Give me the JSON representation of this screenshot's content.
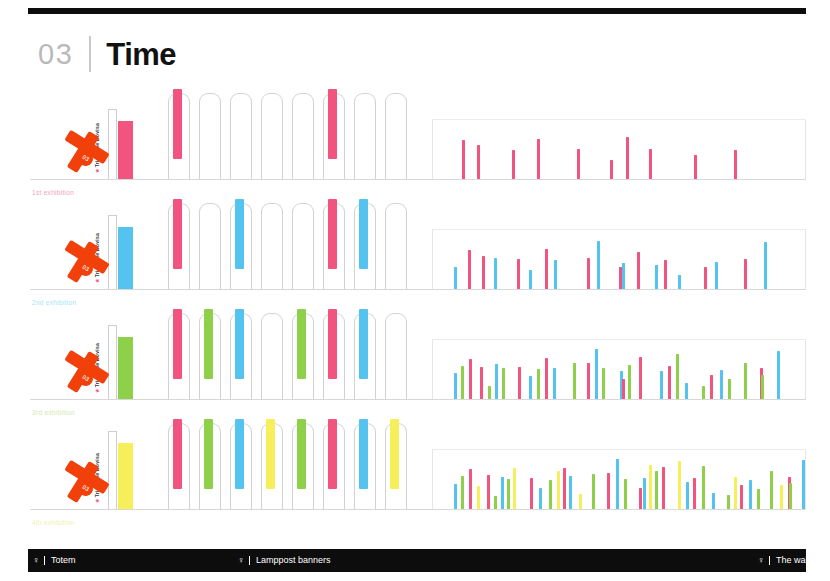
{
  "header": {
    "section_number": "03",
    "title": "Time"
  },
  "colors": {
    "pink": "#f0547f",
    "blue": "#54c3ef",
    "green": "#8ed04a",
    "yellow": "#f7ef5a",
    "orange_sign": "#f2400a",
    "black_bar": "#0d0d0d",
    "lamppost_outline": "#d2d2d2",
    "baseline": "#d8d8d8"
  },
  "legend": {
    "items": [
      {
        "icon": "totem-icon",
        "glyph": "♀",
        "label": "Totem"
      },
      {
        "icon": "lamppost-icon",
        "glyph": "♀",
        "label": "Lamppost banners"
      },
      {
        "icon": "wall-icon",
        "glyph": "♀",
        "label": "The wall"
      }
    ]
  },
  "chart_data": {
    "type": "bar",
    "title": "Time",
    "xlabel": "",
    "ylabel": "",
    "grid": false,
    "legend_position": "bottom",
    "categories": [
      "Totem",
      "Lamppost banners",
      "The wall"
    ],
    "series": [
      {
        "name": "1st exhibition",
        "color": "#f0547f",
        "label_color": "#f7a2b9"
      },
      {
        "name": "2nd exhibition",
        "color": "#54c3ef",
        "label_color": "#a8dff7"
      },
      {
        "name": "3rd exhibition",
        "color": "#8ed04a",
        "label_color": "#d4e9b0"
      },
      {
        "name": "4th exhibition",
        "color": "#f7ef5a",
        "label_color": "#f6f0a8"
      }
    ],
    "rows": [
      {
        "label": "1st exhibition",
        "label_color": "#f7a2b9",
        "totem": {
          "vertical_text": "Triennale Bovisa",
          "bar_color": "#f0547f",
          "bar_height": 58,
          "post_height": 70
        },
        "lampposts": [
          {
            "color": "#f0547f"
          },
          {
            "color": null
          },
          {
            "color": null
          },
          {
            "color": null
          },
          {
            "color": null
          },
          {
            "color": "#f0547f"
          },
          {
            "color": null
          },
          {
            "color": null
          }
        ],
        "wall": {
          "bars": [
            {
              "x": 30,
              "h": 39,
              "color": "#f0547f"
            },
            {
              "x": 45,
              "h": 34,
              "color": "#f0547f"
            },
            {
              "x": 80,
              "h": 29,
              "color": "#f0547f"
            },
            {
              "x": 105,
              "h": 40,
              "color": "#f0547f"
            },
            {
              "x": 145,
              "h": 30,
              "color": "#f0547f"
            },
            {
              "x": 178,
              "h": 19,
              "color": "#f0547f"
            },
            {
              "x": 194,
              "h": 42,
              "color": "#f0547f"
            },
            {
              "x": 217,
              "h": 30,
              "color": "#f0547f"
            },
            {
              "x": 262,
              "h": 24,
              "color": "#f0547f"
            },
            {
              "x": 302,
              "h": 29,
              "color": "#f0547f"
            }
          ]
        }
      },
      {
        "label": "2nd exhibition",
        "label_color": "#a8dff7",
        "totem": {
          "vertical_text": "Triennale Bovisa",
          "bar_color": "#54c3ef",
          "bar_height": 62,
          "post_height": 74
        },
        "lampposts": [
          {
            "color": "#f0547f"
          },
          {
            "color": null
          },
          {
            "color": "#54c3ef"
          },
          {
            "color": null
          },
          {
            "color": null
          },
          {
            "color": "#f0547f"
          },
          {
            "color": "#54c3ef"
          },
          {
            "color": null
          }
        ],
        "wall": {
          "bars": [
            {
              "x": 22,
              "h": 22,
              "color": "#54c3ef"
            },
            {
              "x": 36,
              "h": 39,
              "color": "#f0547f"
            },
            {
              "x": 50,
              "h": 33,
              "color": "#f0547f"
            },
            {
              "x": 62,
              "h": 31,
              "color": "#54c3ef"
            },
            {
              "x": 85,
              "h": 30,
              "color": "#f0547f"
            },
            {
              "x": 97,
              "h": 19,
              "color": "#54c3ef"
            },
            {
              "x": 113,
              "h": 40,
              "color": "#f0547f"
            },
            {
              "x": 122,
              "h": 29,
              "color": "#54c3ef"
            },
            {
              "x": 155,
              "h": 31,
              "color": "#f0547f"
            },
            {
              "x": 165,
              "h": 48,
              "color": "#54c3ef"
            },
            {
              "x": 187,
              "h": 22,
              "color": "#f0547f"
            },
            {
              "x": 190,
              "h": 26,
              "color": "#54c3ef"
            },
            {
              "x": 205,
              "h": 37,
              "color": "#f0547f"
            },
            {
              "x": 223,
              "h": 24,
              "color": "#54c3ef"
            },
            {
              "x": 232,
              "h": 29,
              "color": "#f0547f"
            },
            {
              "x": 246,
              "h": 14,
              "color": "#54c3ef"
            },
            {
              "x": 272,
              "h": 22,
              "color": "#f0547f"
            },
            {
              "x": 283,
              "h": 27,
              "color": "#54c3ef"
            },
            {
              "x": 312,
              "h": 30,
              "color": "#f0547f"
            },
            {
              "x": 332,
              "h": 47,
              "color": "#54c3ef"
            }
          ]
        }
      },
      {
        "label": "3rd exhibition",
        "label_color": "#d4e9b0",
        "totem": {
          "vertical_text": "Triennale Bovisa",
          "bar_color": "#8ed04a",
          "bar_height": 62,
          "post_height": 74
        },
        "lampposts": [
          {
            "color": "#f0547f"
          },
          {
            "color": "#8ed04a"
          },
          {
            "color": "#54c3ef"
          },
          {
            "color": null
          },
          {
            "color": "#8ed04a"
          },
          {
            "color": "#f0547f"
          },
          {
            "color": "#54c3ef"
          },
          {
            "color": null
          }
        ],
        "wall": {
          "bars": [
            {
              "x": 22,
              "h": 26,
              "color": "#54c3ef"
            },
            {
              "x": 29,
              "h": 33,
              "color": "#8ed04a"
            },
            {
              "x": 37,
              "h": 40,
              "color": "#f0547f"
            },
            {
              "x": 48,
              "h": 32,
              "color": "#f0547f"
            },
            {
              "x": 56,
              "h": 13,
              "color": "#8ed04a"
            },
            {
              "x": 63,
              "h": 35,
              "color": "#54c3ef"
            },
            {
              "x": 70,
              "h": 31,
              "color": "#8ed04a"
            },
            {
              "x": 86,
              "h": 32,
              "color": "#f0547f"
            },
            {
              "x": 97,
              "h": 23,
              "color": "#54c3ef"
            },
            {
              "x": 105,
              "h": 30,
              "color": "#8ed04a"
            },
            {
              "x": 113,
              "h": 41,
              "color": "#f0547f"
            },
            {
              "x": 121,
              "h": 31,
              "color": "#54c3ef"
            },
            {
              "x": 141,
              "h": 36,
              "color": "#8ed04a"
            },
            {
              "x": 155,
              "h": 36,
              "color": "#f0547f"
            },
            {
              "x": 163,
              "h": 50,
              "color": "#54c3ef"
            },
            {
              "x": 170,
              "h": 31,
              "color": "#8ed04a"
            },
            {
              "x": 188,
              "h": 28,
              "color": "#54c3ef"
            },
            {
              "x": 190,
              "h": 20,
              "color": "#f0547f"
            },
            {
              "x": 196,
              "h": 34,
              "color": "#8ed04a"
            },
            {
              "x": 207,
              "h": 42,
              "color": "#f0547f"
            },
            {
              "x": 228,
              "h": 28,
              "color": "#54c3ef"
            },
            {
              "x": 236,
              "h": 33,
              "color": "#f0547f"
            },
            {
              "x": 244,
              "h": 45,
              "color": "#8ed04a"
            },
            {
              "x": 253,
              "h": 16,
              "color": "#54c3ef"
            },
            {
              "x": 270,
              "h": 13,
              "color": "#8ed04a"
            },
            {
              "x": 278,
              "h": 24,
              "color": "#f0547f"
            },
            {
              "x": 288,
              "h": 29,
              "color": "#54c3ef"
            },
            {
              "x": 296,
              "h": 20,
              "color": "#8ed04a"
            },
            {
              "x": 312,
              "h": 36,
              "color": "#8ed04a"
            },
            {
              "x": 328,
              "h": 31,
              "color": "#f0547f"
            },
            {
              "x": 329,
              "h": 24,
              "color": "#8ed04a"
            },
            {
              "x": 345,
              "h": 48,
              "color": "#54c3ef"
            }
          ]
        }
      },
      {
        "label": "4th exhibition",
        "label_color": "#f6f0a8",
        "totem": {
          "vertical_text": "Triennale Bovisa",
          "bar_color": "#f7ef5a",
          "bar_height": 66,
          "post_height": 78
        },
        "lampposts": [
          {
            "color": "#f0547f"
          },
          {
            "color": "#8ed04a"
          },
          {
            "color": "#54c3ef"
          },
          {
            "color": "#f7ef5a"
          },
          {
            "color": "#8ed04a"
          },
          {
            "color": "#f0547f"
          },
          {
            "color": "#54c3ef"
          },
          {
            "color": "#f7ef5a"
          }
        ],
        "wall": {
          "bars": [
            {
              "x": 22,
              "h": 25,
              "color": "#54c3ef"
            },
            {
              "x": 29,
              "h": 33,
              "color": "#8ed04a"
            },
            {
              "x": 37,
              "h": 40,
              "color": "#f0547f"
            },
            {
              "x": 45,
              "h": 23,
              "color": "#f7ef5a"
            },
            {
              "x": 55,
              "h": 34,
              "color": "#f0547f"
            },
            {
              "x": 62,
              "h": 13,
              "color": "#8ed04a"
            },
            {
              "x": 69,
              "h": 32,
              "color": "#54c3ef"
            },
            {
              "x": 75,
              "h": 30,
              "color": "#8ed04a"
            },
            {
              "x": 81,
              "h": 41,
              "color": "#f7ef5a"
            },
            {
              "x": 98,
              "h": 31,
              "color": "#f0547f"
            },
            {
              "x": 107,
              "h": 21,
              "color": "#54c3ef"
            },
            {
              "x": 117,
              "h": 29,
              "color": "#8ed04a"
            },
            {
              "x": 125,
              "h": 38,
              "color": "#f7ef5a"
            },
            {
              "x": 131,
              "h": 41,
              "color": "#f0547f"
            },
            {
              "x": 137,
              "h": 33,
              "color": "#54c3ef"
            },
            {
              "x": 147,
              "h": 15,
              "color": "#f7ef5a"
            },
            {
              "x": 160,
              "h": 35,
              "color": "#8ed04a"
            },
            {
              "x": 175,
              "h": 36,
              "color": "#f0547f"
            },
            {
              "x": 184,
              "h": 50,
              "color": "#54c3ef"
            },
            {
              "x": 192,
              "h": 30,
              "color": "#8ed04a"
            },
            {
              "x": 207,
              "h": 21,
              "color": "#f0547f"
            },
            {
              "x": 211,
              "h": 31,
              "color": "#54c3ef"
            },
            {
              "x": 217,
              "h": 44,
              "color": "#f7ef5a"
            },
            {
              "x": 223,
              "h": 38,
              "color": "#8ed04a"
            },
            {
              "x": 230,
              "h": 42,
              "color": "#f0547f"
            },
            {
              "x": 246,
              "h": 48,
              "color": "#f7ef5a"
            },
            {
              "x": 254,
              "h": 27,
              "color": "#54c3ef"
            },
            {
              "x": 261,
              "h": 31,
              "color": "#f0547f"
            },
            {
              "x": 270,
              "h": 43,
              "color": "#8ed04a"
            },
            {
              "x": 280,
              "h": 16,
              "color": "#54c3ef"
            },
            {
              "x": 295,
              "h": 14,
              "color": "#8ed04a"
            },
            {
              "x": 302,
              "h": 32,
              "color": "#f7ef5a"
            },
            {
              "x": 308,
              "h": 24,
              "color": "#f0547f"
            },
            {
              "x": 317,
              "h": 29,
              "color": "#54c3ef"
            },
            {
              "x": 325,
              "h": 20,
              "color": "#8ed04a"
            },
            {
              "x": 338,
              "h": 38,
              "color": "#8ed04a"
            },
            {
              "x": 348,
              "h": 24,
              "color": "#f7ef5a"
            },
            {
              "x": 356,
              "h": 32,
              "color": "#f0547f"
            },
            {
              "x": 357,
              "h": 26,
              "color": "#8ed04a"
            },
            {
              "x": 370,
              "h": 49,
              "color": "#54c3ef"
            }
          ]
        }
      }
    ]
  }
}
